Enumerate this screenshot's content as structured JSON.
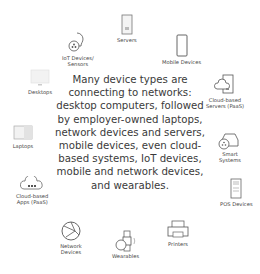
{
  "center_text": "Many device types are connecting to networks: desktop computers, followed by employer-owned laptops, network devices and servers, mobile devices, even cloud-based systems, IoT devices, mobile and network devices, and wearables.",
  "nodes": {
    "iot": {
      "label_1": "IoT Devices/",
      "label_2": "Sensors"
    },
    "servers": {
      "label": "Servers"
    },
    "mobile": {
      "label": "Mobile Devices"
    },
    "desktops": {
      "label": "Desktops"
    },
    "cloud_servers": {
      "label_1": "Cloud-based",
      "label_2": "Servers (PaaS)"
    },
    "laptops": {
      "label": "Laptops"
    },
    "smart": {
      "label_1": "Smart",
      "label_2": "Systems"
    },
    "cloud_apps": {
      "label_1": "Cloud-based",
      "label_2": "Apps (PaaS)"
    },
    "pos": {
      "label": "POS Devices"
    },
    "network": {
      "label_1": "Network",
      "label_2": "Devices"
    },
    "printers": {
      "label": "Printers"
    },
    "wearables": {
      "label": "Wearables"
    }
  }
}
